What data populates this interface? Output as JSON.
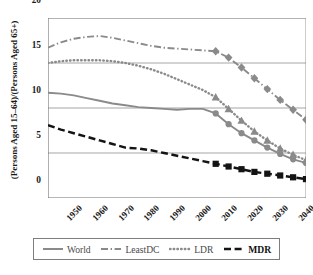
{
  "chart_data": {
    "type": "line",
    "title": "",
    "xlabel": "",
    "ylabel": "(Persons Aged 15–64)/(Persons Aged 65+)",
    "xlim": [
      1950,
      2050
    ],
    "ylim": [
      0,
      20
    ],
    "yticks": [
      0,
      5,
      10,
      15,
      20
    ],
    "xticks": [
      1950,
      1960,
      1970,
      1980,
      1990,
      2000,
      2010,
      2020,
      2030,
      2040,
      2050
    ],
    "xtick_labels": [
      "1950",
      "1960",
      "1970",
      "1980",
      "1990",
      "2000",
      "2010",
      "2020",
      "2030",
      "2040",
      "2050"
    ],
    "ytick_labels": [
      "0",
      "5",
      "10",
      "15",
      "20"
    ],
    "grid": "horizontal",
    "legend_position": "bottom",
    "x": [
      1950,
      1955,
      1960,
      1965,
      1970,
      1975,
      1980,
      1985,
      1990,
      1995,
      2000,
      2005,
      2010,
      2015,
      2020,
      2025,
      2030,
      2035,
      2040,
      2045,
      2050
    ],
    "series": [
      {
        "name": "World",
        "style": "solid",
        "color": "#8a8a8a",
        "marker": "circle",
        "marker_from": 2015,
        "values": [
          11.7,
          11.6,
          11.4,
          11.1,
          10.8,
          10.5,
          10.3,
          10.1,
          10.0,
          9.9,
          9.8,
          9.9,
          9.9,
          9.4,
          8.2,
          7.2,
          6.4,
          5.6,
          4.9,
          4.3,
          3.9
        ]
      },
      {
        "name": "LeastDC",
        "style": "dash-dot",
        "color": "#8a8a8a",
        "marker": "diamond",
        "marker_from": 2015,
        "values": [
          16.7,
          17.3,
          17.7,
          17.9,
          18.0,
          17.8,
          17.5,
          17.2,
          16.9,
          16.7,
          16.6,
          16.5,
          16.4,
          16.3,
          15.6,
          14.5,
          13.3,
          12.1,
          10.9,
          9.8,
          8.7
        ]
      },
      {
        "name": "LDR",
        "style": "dotted",
        "color": "#8a8a8a",
        "marker": "triangle",
        "marker_from": 2015,
        "values": [
          15.0,
          15.2,
          15.3,
          15.3,
          15.3,
          15.2,
          15.0,
          14.7,
          14.3,
          13.8,
          13.2,
          12.6,
          12.0,
          11.2,
          9.9,
          8.6,
          7.4,
          6.4,
          5.5,
          4.8,
          4.2
        ]
      },
      {
        "name": "MDR",
        "style": "dashed",
        "color": "#141414",
        "marker": "square",
        "marker_from": 2015,
        "values": [
          8.1,
          7.6,
          7.2,
          6.8,
          6.4,
          6.0,
          5.6,
          5.5,
          5.3,
          5.0,
          4.7,
          4.4,
          4.1,
          3.8,
          3.5,
          3.2,
          2.9,
          2.7,
          2.5,
          2.3,
          2.1
        ]
      }
    ]
  },
  "legend": {
    "items": [
      {
        "label": "World",
        "swatch": "solid-gray-line"
      },
      {
        "label": "LeastDC",
        "swatch": "dash-dot-gray-line"
      },
      {
        "label": "LDR",
        "swatch": "dotted-gray-line"
      },
      {
        "label": "MDR",
        "swatch": "dashed-black-line"
      }
    ]
  },
  "caption": ""
}
